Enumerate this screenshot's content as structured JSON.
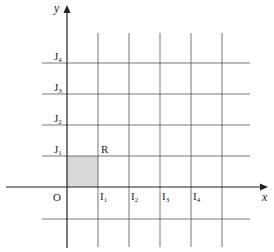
{
  "diagram": {
    "type": "coordinate-grid",
    "axes": {
      "x_label": "x",
      "y_label": "y",
      "origin_label": "O"
    },
    "x_ticks": [
      {
        "base": "I",
        "sub": "1"
      },
      {
        "base": "I",
        "sub": "2"
      },
      {
        "base": "I",
        "sub": "3"
      },
      {
        "base": "I",
        "sub": "4"
      }
    ],
    "y_ticks": [
      {
        "base": "J",
        "sub": "1"
      },
      {
        "base": "J",
        "sub": "2"
      },
      {
        "base": "J",
        "sub": "3"
      },
      {
        "base": "J",
        "sub": "4"
      }
    ],
    "region": {
      "label": "R",
      "fill": "#d9d9d9",
      "description": "unit square between O, I1 and J1"
    },
    "colors": {
      "line": "#555555",
      "axis": "#222222",
      "shade": "#d9d9d9"
    }
  }
}
